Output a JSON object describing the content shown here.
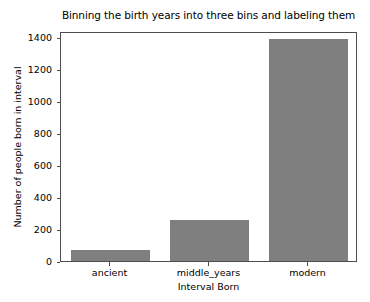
{
  "chart_data": {
    "type": "bar",
    "title": "Binning the birth years into three bins and labeling them",
    "xlabel": "Interval Born",
    "ylabel": "Number of people born in interval",
    "categories": [
      "ancient",
      "middle_years",
      "modern"
    ],
    "values": [
      70,
      258,
      1390
    ],
    "ylim": [
      0,
      1440
    ],
    "yticks": [
      0,
      200,
      400,
      600,
      800,
      1000,
      1200,
      1400
    ],
    "ytick_labels": [
      "0",
      "200",
      "400",
      "600",
      "800",
      "1000",
      "1200",
      "1400"
    ],
    "grid": false,
    "legend": null,
    "bar_color": "#7f7f7f",
    "axes_color": "#4d4d4d",
    "background": "#ffffff"
  }
}
